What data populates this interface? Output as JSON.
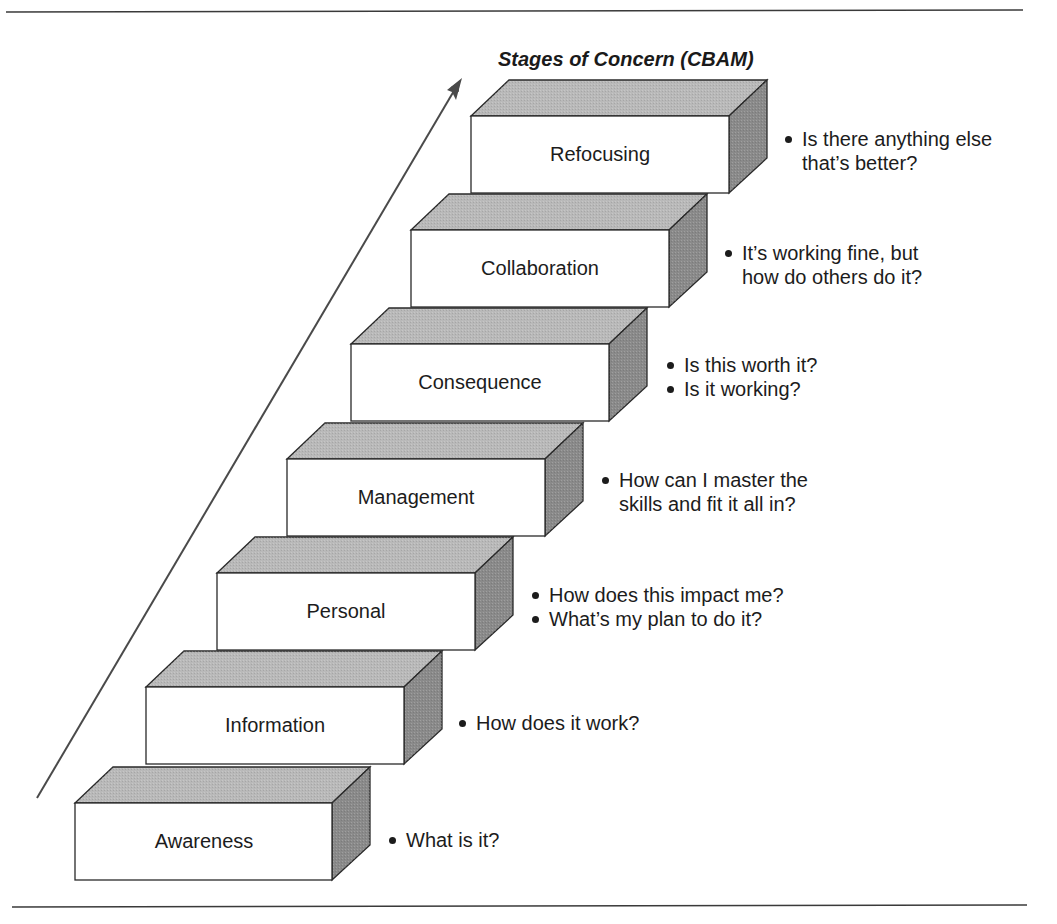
{
  "figure": {
    "title": "Stages of Concern (CBAM)",
    "colors": {
      "front_face": "#ffffff",
      "top_face": "#b9b9b9",
      "side_face": "#8a8a8a",
      "stroke": "#2a2a2a",
      "arrow": "#4a4a4a",
      "rule": "#3a3a3a"
    },
    "stages": [
      {
        "label": "Awareness",
        "questions": [
          "What is it?"
        ]
      },
      {
        "label": "Information",
        "questions": [
          "How does it work?"
        ]
      },
      {
        "label": "Personal",
        "questions": [
          "How does this impact me?",
          "What’s my plan to do it?"
        ]
      },
      {
        "label": "Management",
        "questions": [
          "How can I master the skills and fit it all in?"
        ]
      },
      {
        "label": "Consequence",
        "questions": [
          "Is this worth it?",
          "Is it working?"
        ]
      },
      {
        "label": "Collaboration",
        "questions": [
          "It’s working fine, but how do others do it?"
        ]
      },
      {
        "label": "Refocusing",
        "questions": [
          "Is there anything else that’s better?"
        ]
      }
    ],
    "question_lines": {
      "awareness": [
        "What is it?"
      ],
      "information": [
        "How does it work?"
      ],
      "personal": [
        "How does this impact me?",
        "What’s my plan to do it?"
      ],
      "management": [
        "How can I master the",
        "skills and fit it all in?"
      ],
      "consequence": [
        "Is this worth it?",
        "Is it working?"
      ],
      "collaboration": [
        "It’s working fine, but",
        "how do others do it?"
      ],
      "refocusing": [
        "Is there anything else",
        "that’s better?"
      ]
    }
  }
}
